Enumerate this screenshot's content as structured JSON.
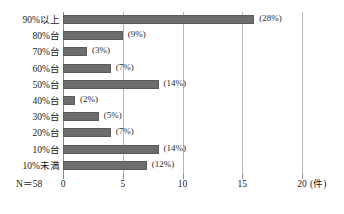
{
  "chart_data": {
    "type": "bar",
    "orientation": "horizontal",
    "title": "",
    "xlabel": "(件)",
    "ylabel": "",
    "xlim": [
      0,
      20
    ],
    "xticks": [
      0,
      5,
      10,
      15,
      20
    ],
    "xtick_labels": [
      "0",
      "5",
      "10",
      "15",
      "20"
    ],
    "x_unit_label": "(件)",
    "grid": true,
    "grid_axis": "x",
    "legend": false,
    "categories": [
      "90%以上",
      "80%台",
      "70%台",
      "60%台",
      "50%台",
      "40%台",
      "30%台",
      "20%台",
      "10%台",
      "10%未満"
    ],
    "values": [
      16,
      5,
      2,
      4,
      8,
      1,
      3,
      4,
      8,
      7
    ],
    "data_labels": [
      "(28%)",
      "(9%)",
      "(3%)",
      "(7%)",
      "(14%)",
      "(2%)",
      "(5%)",
      "(7%)",
      "(14%)",
      "(12%)"
    ],
    "annotations": [
      "N＝58"
    ],
    "bar_color": "#6d6d6d",
    "grid_color": "#b7b7b7",
    "axis_color": "#8c8c8c"
  },
  "sample_size_label": "N＝58",
  "x_axis_unit": "(件)"
}
